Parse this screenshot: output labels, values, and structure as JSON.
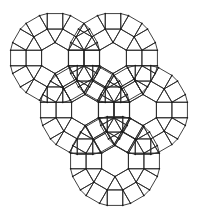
{
  "diagram": {
    "type": "polygon-tiling",
    "tile_shapes": [
      "hexagon",
      "square",
      "triangle"
    ],
    "edge_length_px": 15.5,
    "line_color": "#2a2a2a",
    "background_color": "#ffffff",
    "rosettes": [
      {
        "id": "rosette-top-left",
        "cx": 55,
        "cy": 58
      },
      {
        "id": "rosette-top-right",
        "cx": 113,
        "cy": 58
      },
      {
        "id": "rosette-middle-left",
        "cx": 85,
        "cy": 110
      },
      {
        "id": "rosette-middle-right",
        "cx": 143,
        "cy": 110
      },
      {
        "id": "rosette-bottom",
        "cx": 115,
        "cy": 161
      }
    ]
  }
}
